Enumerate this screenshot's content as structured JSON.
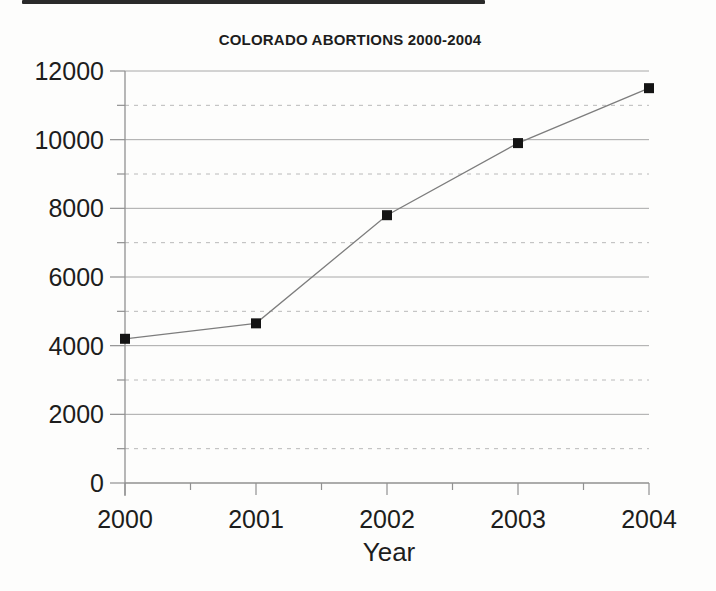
{
  "page": {
    "background": "#fdfdfc",
    "rule_color": "#2a2a2a"
  },
  "chart_data": {
    "type": "line",
    "title": "COLORADO ABORTIONS 2000-2004",
    "xlabel": "Year",
    "ylabel": "",
    "categories": [
      "2000",
      "2001",
      "2002",
      "2003",
      "2004"
    ],
    "series": [
      {
        "name": "abortions",
        "values": [
          4200,
          4650,
          7800,
          9900,
          11500
        ]
      }
    ],
    "ylim": [
      0,
      12000
    ],
    "y_major_step": 2000,
    "y_minor_step": 1000,
    "grid": "major-solid-minor-dashed",
    "legend": "none",
    "marker": "black-square",
    "colors": {
      "marker": "#141414",
      "line": "#7d7d7d",
      "major_grid": "#a8a8a8",
      "minor_grid": "#bababa",
      "axis": "#919191",
      "text": "#1d1d1d"
    }
  }
}
